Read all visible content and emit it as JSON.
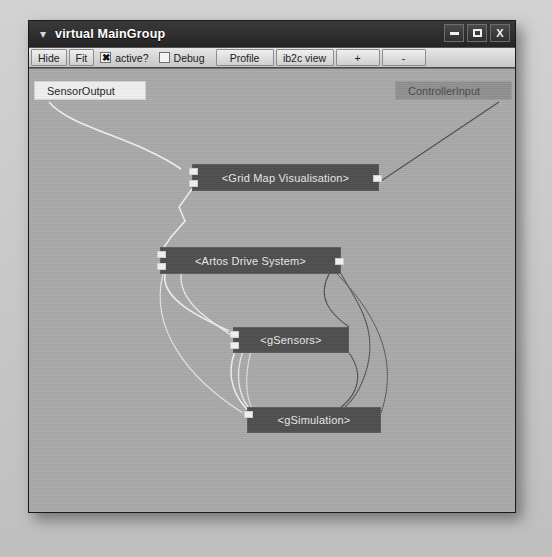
{
  "window": {
    "title": "virtual MainGroup",
    "chevron_icon": "chevron-down-icon",
    "buttons": {
      "minimize": "minimize-icon",
      "maximize": "maximize-icon",
      "close": "X"
    }
  },
  "toolbar": {
    "hide_label": "Hide",
    "fit_label": "Fit",
    "active_checkbox": {
      "label": "active?",
      "mark": "✖",
      "checked": true
    },
    "debug_checkbox": {
      "label": "Debug",
      "mark": "",
      "checked": false
    },
    "profile_label": "Profile",
    "ib2c_label": "ib2c view",
    "zoom_in_label": "+",
    "zoom_out_label": "-"
  },
  "canvas": {
    "nodes": [
      {
        "id": "sensor-output",
        "label": "SensorOutput",
        "kind": "io-light",
        "x": 5,
        "y": 12,
        "w": 112,
        "h": 19
      },
      {
        "id": "controller-input",
        "label": "ControllerInput",
        "kind": "io-dark",
        "x": 366,
        "y": 12,
        "w": 117,
        "h": 19
      },
      {
        "id": "grid-map",
        "label": "<Grid Map Visualisation>",
        "kind": "module",
        "x": 163,
        "y": 95,
        "w": 187,
        "h": 27
      },
      {
        "id": "artos-drive",
        "label": "<Artos Drive System>",
        "kind": "module",
        "x": 131,
        "y": 178,
        "w": 181,
        "h": 27
      },
      {
        "id": "gsensors",
        "label": "<gSensors>",
        "kind": "module",
        "x": 204,
        "y": 258,
        "w": 116,
        "h": 26
      },
      {
        "id": "gsimulation",
        "label": "<gSimulation>",
        "kind": "module",
        "x": 218,
        "y": 338,
        "w": 134,
        "h": 26
      }
    ],
    "wire_colors": {
      "light": "#f0f0f0",
      "dark": "#4f4f4f"
    }
  }
}
